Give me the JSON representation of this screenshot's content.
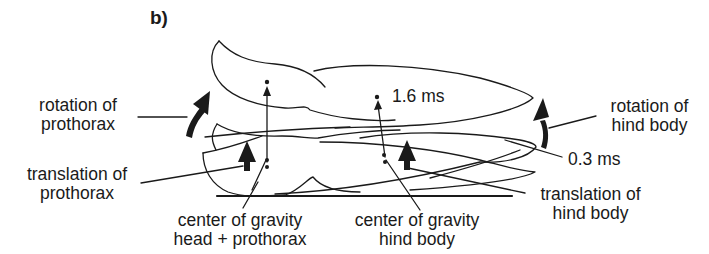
{
  "figure": {
    "panel_label": "b)",
    "ink_color": "#1a1a1a",
    "background": "#ffffff"
  },
  "labels": {
    "rotation_prothorax": [
      "rotation of",
      "prothorax"
    ],
    "translation_prothorax": [
      "translation of",
      "prothorax"
    ],
    "cog_head_prothorax": [
      "center of gravity",
      "head + prothorax"
    ],
    "cog_hind_body": [
      "center of gravity",
      "hind body"
    ],
    "rotation_hind_body": [
      "rotation of",
      "hind body"
    ],
    "translation_hind_body": [
      "translation of",
      "hind body"
    ],
    "time_upper": "1.6 ms",
    "time_lower": "0.3 ms"
  }
}
